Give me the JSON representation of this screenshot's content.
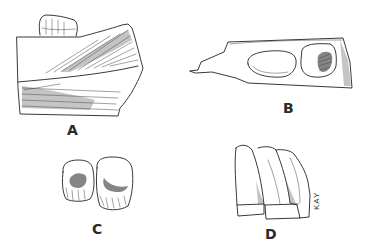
{
  "figure": {
    "panels": [
      {
        "id": "A",
        "label": "A",
        "subject": "jaw fragment with tooth, lateral view"
      },
      {
        "id": "B",
        "label": "B",
        "subject": "jaw fragment, occlusal view with two teeth"
      },
      {
        "id": "C",
        "label": "C",
        "subject": "two teeth, crown view"
      },
      {
        "id": "D",
        "label": "D",
        "subject": "tooth row, lateral view"
      }
    ],
    "signature": "KAY"
  },
  "colors": {
    "background": "#ffffff",
    "ink": "#222222"
  }
}
